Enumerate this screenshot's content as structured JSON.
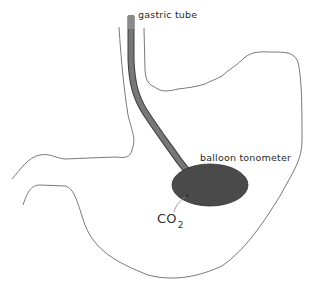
{
  "diagram": {
    "labels": {
      "gastric_tube": "gastric tube",
      "balloon_tonometer": "balloon tonometer",
      "co2_main": "CO",
      "co2_sub": "2"
    },
    "components": [
      {
        "name": "stomach-outline",
        "kind": "contour"
      },
      {
        "name": "esophagus-walls",
        "kind": "contour"
      },
      {
        "name": "duodenum-outline",
        "kind": "contour"
      },
      {
        "name": "gastric-tube",
        "kind": "tube"
      },
      {
        "name": "balloon-tonometer",
        "kind": "ellipse"
      },
      {
        "name": "co2-arrow",
        "kind": "arrow",
        "from": "CO2",
        "to": "balloon tonometer"
      }
    ],
    "colors": {
      "outline": "#555555",
      "tube": "#6e6e6e",
      "tube_edge": "#444444",
      "balloon": "#4a4a4a",
      "text": "#2a2a2a"
    }
  }
}
